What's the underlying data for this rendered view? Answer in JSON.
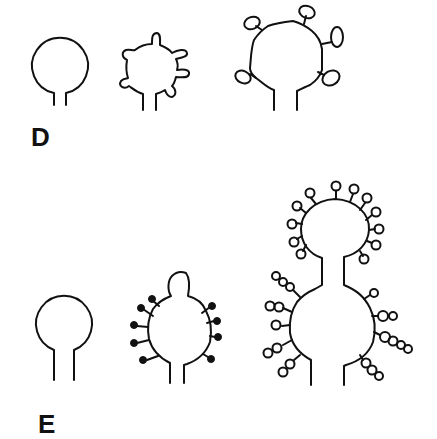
{
  "figure": {
    "panels": [
      {
        "label": "D",
        "description": "Row of three loop structures of increasing decoration",
        "structures": [
          {
            "id": "D1",
            "form": "plain circular loop on two-stranded stem"
          },
          {
            "id": "D2",
            "form": "loop with 6 short rounded protrusions"
          },
          {
            "id": "D3",
            "form": "loop with 5 stalks ending in oval knobs"
          }
        ]
      },
      {
        "label": "E",
        "description": "Row of three loop structures of increasing complexity",
        "structures": [
          {
            "id": "E1",
            "form": "plain circular loop on two-stranded stem"
          },
          {
            "id": "E2",
            "form": "loop with small apical bulge and 8 short stalks ending in filled dots"
          },
          {
            "id": "E3",
            "form": "two stacked loops joined by a neck, bearing many stalks with chains of open beads"
          }
        ]
      }
    ],
    "line_color": "#111111",
    "background": "#ffffff"
  }
}
